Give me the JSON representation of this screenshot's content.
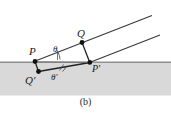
{
  "figure": {
    "caption": "(b)",
    "colors": {
      "background": "#ffffff",
      "medium_fill": "#d9d9d9",
      "interface_line": "#8c8c8c",
      "ray_line": "#3a3a3a",
      "point_marker": "#111111",
      "label_text": "#1a1a1a"
    },
    "interface": {
      "label": "medium-interface",
      "y": 62
    },
    "points": [
      {
        "id": "P",
        "label": "P",
        "x": 35,
        "y": 61.5
      },
      {
        "id": "Q",
        "label": "Q",
        "x": 82,
        "y": 42.5
      },
      {
        "id": "Qprime",
        "label": "Q′",
        "x": 38,
        "y": 71.5
      },
      {
        "id": "Pprime",
        "label": "P′",
        "x": 90,
        "y": 62.5
      }
    ],
    "angles": [
      {
        "id": "theta",
        "label": "θ",
        "x": 55,
        "y": 48,
        "description": "angle of incidence at P"
      },
      {
        "id": "theta-prime",
        "label": "θ′",
        "x": 54,
        "y": 72,
        "description": "angle of refraction at P′"
      }
    ],
    "rays": [
      {
        "id": "incident-ray-upper",
        "from": "P",
        "to": "upper-right-edge"
      },
      {
        "id": "incident-ray-lower",
        "from": "Pprime",
        "to": "lower-right-edge"
      },
      {
        "id": "wavefront-PQprime",
        "from": "P",
        "to": "Qprime"
      },
      {
        "id": "wavefront-QPprime",
        "from": "Q",
        "to": "Pprime"
      },
      {
        "id": "refracted-ray-QprimePprime",
        "from": "Qprime",
        "to": "Pprime"
      }
    ]
  }
}
